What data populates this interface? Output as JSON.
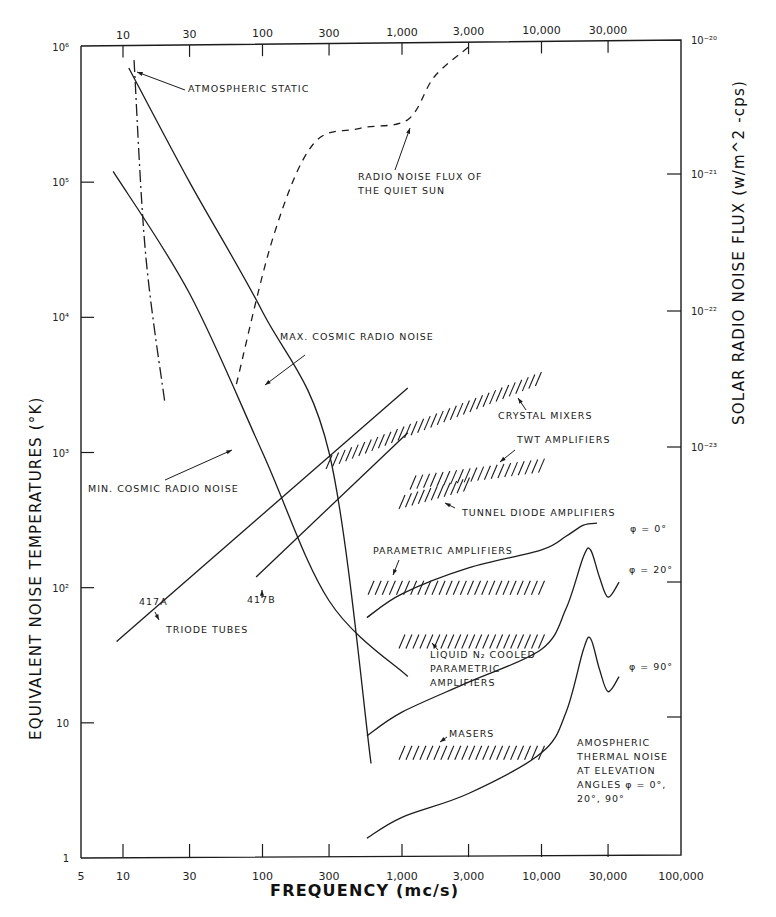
{
  "chart_data": {
    "type": "line",
    "title": "",
    "xlabel": "FREQUENCY (mc/s)",
    "ylabel": "EQUIVALENT NOISE TEMPERATURES (°K)",
    "y2label": "SOLAR RADIO NOISE FLUX (w/m^2 -cps)",
    "x_scale": "log",
    "y_scale": "log",
    "xlim": [
      5,
      100000
    ],
    "ylim": [
      1,
      1000000
    ],
    "grid": false,
    "x_ticks_bottom": [
      {
        "v": 5,
        "label": "5"
      },
      {
        "v": 10,
        "label": "10"
      },
      {
        "v": 30,
        "label": "30"
      },
      {
        "v": 100,
        "label": "100"
      },
      {
        "v": 300,
        "label": "300"
      },
      {
        "v": 1000,
        "label": "1,000"
      },
      {
        "v": 3000,
        "label": "3,000"
      },
      {
        "v": 10000,
        "label": "10,000"
      },
      {
        "v": 30000,
        "label": "30,000"
      },
      {
        "v": 100000,
        "label": "100,000"
      }
    ],
    "x_ticks_top": [
      {
        "v": 10,
        "label": "10"
      },
      {
        "v": 30,
        "label": "30"
      },
      {
        "v": 100,
        "label": "100"
      },
      {
        "v": 300,
        "label": "300"
      },
      {
        "v": 1000,
        "label": "1,000"
      },
      {
        "v": 3000,
        "label": "3,000"
      },
      {
        "v": 10000,
        "label": "10,000"
      },
      {
        "v": 30000,
        "label": "30,000"
      }
    ],
    "y_ticks_left": [
      {
        "v": 1,
        "label": "1"
      },
      {
        "v": 10,
        "label": "10"
      },
      {
        "v": 100,
        "label": "10²"
      },
      {
        "v": 1000,
        "label": "10³"
      },
      {
        "v": 10000,
        "label": "10⁴"
      },
      {
        "v": 100000,
        "label": "10⁵"
      },
      {
        "v": 1000000,
        "label": "10⁶"
      }
    ],
    "y_ticks_right": [
      {
        "ypx": 40,
        "label": "10⁻²⁰"
      },
      {
        "ypx": 174,
        "label": "10⁻²¹"
      },
      {
        "ypx": 311,
        "label": "10⁻²²"
      },
      {
        "ypx": 447,
        "label": "10⁻²³"
      },
      {
        "ypx": 582,
        "label": ""
      },
      {
        "ypx": 717,
        "label": ""
      }
    ],
    "series": [
      {
        "name": "Max. cosmic radio noise",
        "style": "solid",
        "points": [
          [
            11,
            700000
          ],
          [
            30,
            100000
          ],
          [
            100,
            11000
          ],
          [
            300,
            1000
          ],
          [
            600,
            5
          ]
        ]
      },
      {
        "name": "Min. cosmic radio noise",
        "style": "solid",
        "points": [
          [
            8.5,
            120000
          ],
          [
            30,
            15000
          ],
          [
            100,
            1000
          ],
          [
            300,
            80
          ],
          [
            1100,
            22
          ]
        ]
      },
      {
        "name": "Atmospheric static",
        "style": "dashdot",
        "points": [
          [
            12,
            800000
          ],
          [
            14.5,
            30000
          ],
          [
            20,
            2300
          ]
        ]
      },
      {
        "name": "Radio noise flux of the quiet sun",
        "style": "dashed",
        "points": [
          [
            65,
            3200
          ],
          [
            120,
            40000
          ],
          [
            230,
            190000
          ],
          [
            500,
            250000
          ],
          [
            1100,
            290000
          ],
          [
            1700,
            600000
          ],
          [
            3000,
            1000000
          ]
        ]
      },
      {
        "name": "Triode tube 417A",
        "style": "solid",
        "points": [
          [
            9,
            40
          ],
          [
            1100,
            3000
          ]
        ]
      },
      {
        "name": "Triode tube 417B",
        "style": "solid",
        "points": [
          [
            90,
            120
          ],
          [
            1100,
            1400
          ]
        ]
      },
      {
        "name": "Atmospheric thermal noise φ=0°",
        "style": "solid",
        "points": [
          [
            560,
            60
          ],
          [
            1000,
            90
          ],
          [
            3000,
            140
          ],
          [
            10000,
            190
          ],
          [
            15000,
            240
          ],
          [
            20000,
            290
          ],
          [
            25000,
            300
          ]
        ]
      },
      {
        "name": "Atmospheric thermal noise φ=20°",
        "style": "solid",
        "points": [
          [
            560,
            8
          ],
          [
            1000,
            12
          ],
          [
            3000,
            20
          ],
          [
            10000,
            35
          ],
          [
            15000,
            70
          ],
          [
            20000,
            170
          ],
          [
            22500,
            190
          ],
          [
            26000,
            120
          ],
          [
            30000,
            85
          ],
          [
            36000,
            110
          ]
        ]
      },
      {
        "name": "Atmospheric thermal noise φ=90°",
        "style": "solid",
        "points": [
          [
            560,
            1.4
          ],
          [
            1000,
            2
          ],
          [
            3000,
            3
          ],
          [
            10000,
            6
          ],
          [
            15000,
            12
          ],
          [
            20000,
            35
          ],
          [
            22500,
            42
          ],
          [
            26000,
            25
          ],
          [
            30000,
            17
          ],
          [
            36000,
            22
          ]
        ]
      }
    ],
    "hatched_bands": [
      {
        "name": "Crystal mixers",
        "from": [
          300,
          850
        ],
        "to": [
          9500,
          3500
        ]
      },
      {
        "name": "TWT amplifiers",
        "from": [
          1200,
          600
        ],
        "to": [
          10000,
          800
        ]
      },
      {
        "name": "Tunnel diode amplifiers",
        "from": [
          1000,
          430
        ],
        "to": [
          2900,
          580
        ]
      },
      {
        "name": "Parametric amplifiers",
        "from": [
          600,
          100
        ],
        "to": [
          10000,
          100
        ]
      },
      {
        "name": "Liquid N2 cooled parametric amplifiers",
        "from": [
          1000,
          40
        ],
        "to": [
          10000,
          40
        ]
      },
      {
        "name": "Masers",
        "from": [
          1000,
          6
        ],
        "to": [
          10000,
          6
        ]
      }
    ],
    "annotations": [
      {
        "text": "ATMOSPHERIC STATIC",
        "x": 188,
        "y": 92
      },
      {
        "text": "RADIO NOISE FLUX OF",
        "x": 358,
        "y": 180
      },
      {
        "text": "THE QUIET SUN",
        "x": 358,
        "y": 194
      },
      {
        "text": "MAX. COSMIC RADIO NOISE",
        "x": 280,
        "y": 340
      },
      {
        "text": "MIN. COSMIC RADIO NOISE",
        "x": 88,
        "y": 492
      },
      {
        "text": "CRYSTAL MIXERS",
        "x": 498,
        "y": 419
      },
      {
        "text": "TWT AMPLIFIERS",
        "x": 517,
        "y": 443
      },
      {
        "text": "TUNNEL DIODE AMPLIFIERS",
        "x": 462,
        "y": 516
      },
      {
        "text": "φ = 0°",
        "x": 630,
        "y": 532
      },
      {
        "text": "PARAMETRIC AMPLIFIERS",
        "x": 373,
        "y": 554
      },
      {
        "text": "φ = 20°",
        "x": 629,
        "y": 573
      },
      {
        "text": "417A",
        "x": 139,
        "y": 605
      },
      {
        "text": "417B",
        "x": 247,
        "y": 603
      },
      {
        "text": "TRIODE TUBES",
        "x": 166,
        "y": 633
      },
      {
        "text": "LIQUID N₂ COOLED",
        "x": 430,
        "y": 658
      },
      {
        "text": "PARAMETRIC",
        "x": 430,
        "y": 672
      },
      {
        "text": "AMPLIFIERS",
        "x": 430,
        "y": 686
      },
      {
        "text": "φ = 90°",
        "x": 629,
        "y": 670
      },
      {
        "text": "MASERS",
        "x": 449,
        "y": 737
      },
      {
        "text": "AMOSPHERIC",
        "x": 577,
        "y": 746
      },
      {
        "text": "THERMAL NOISE",
        "x": 577,
        "y": 760
      },
      {
        "text": "AT ELEVATION",
        "x": 577,
        "y": 774
      },
      {
        "text": "ANGLES φ = 0°,",
        "x": 577,
        "y": 788
      },
      {
        "text": "20°, 90°",
        "x": 577,
        "y": 802
      }
    ]
  }
}
